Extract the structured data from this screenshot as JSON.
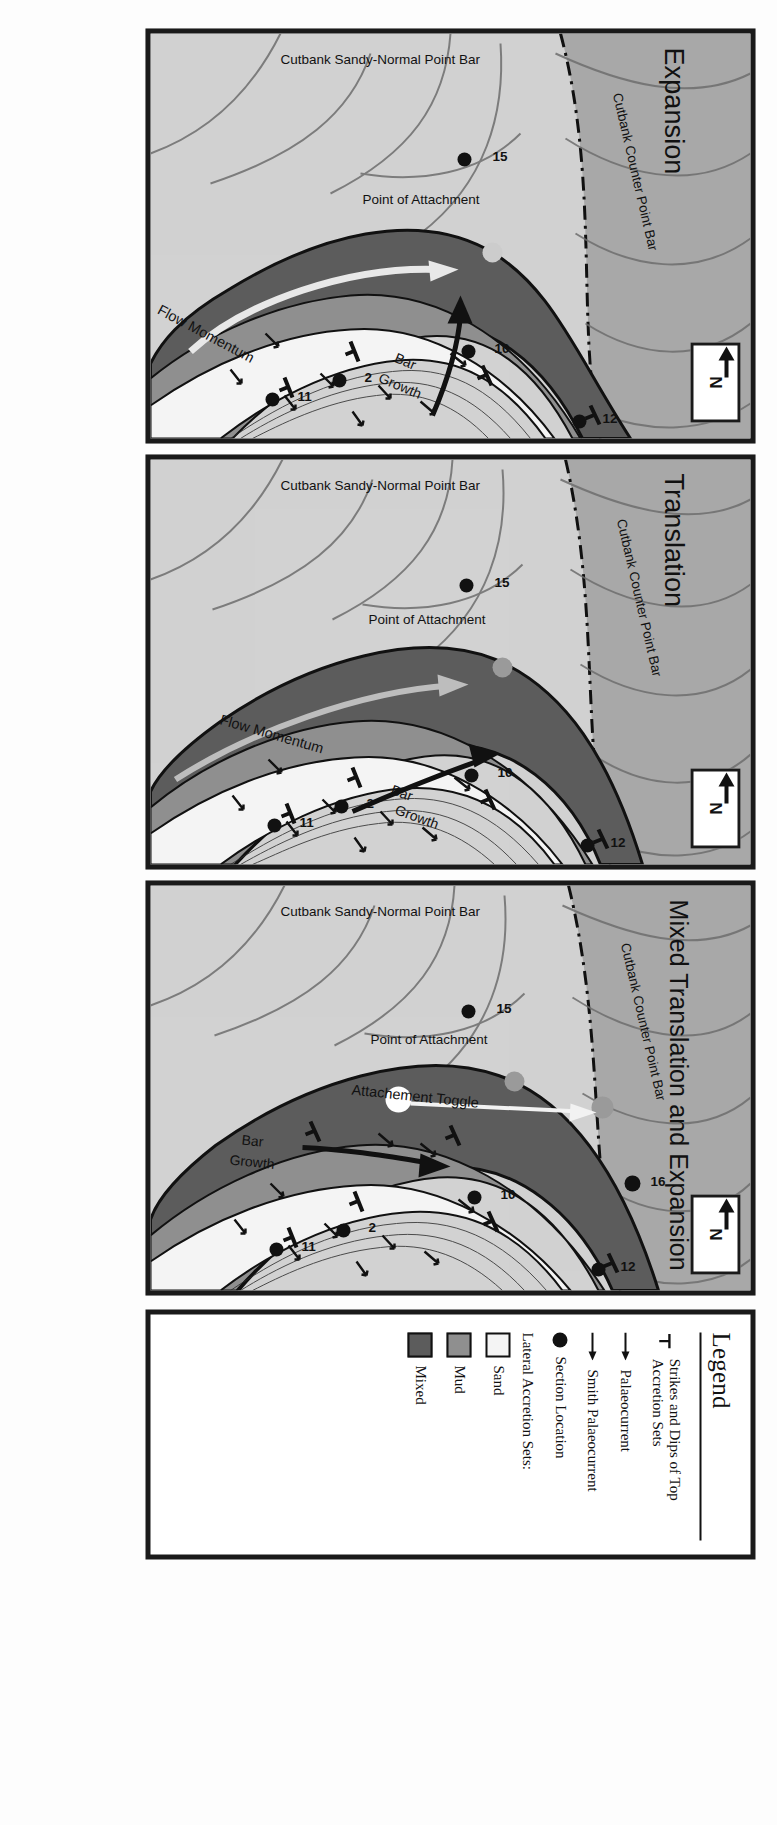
{
  "figure": {
    "orientation": "rotated-90",
    "panel_count": 3
  },
  "colors": {
    "sand": "#f4f4f4",
    "mud": "#8f8f8f",
    "mixed": "#5c5c5c",
    "background_bar": "#d2d2d2",
    "counter_point_bar": "#a8a8a8",
    "outline": "#1a1a1a",
    "accretion_line": "#6e6e6e",
    "flow_arrow": "#e8e8e8",
    "attachment_dot": "#9a9a9a",
    "toggle_dot_white": "#ffffff"
  },
  "panels": [
    {
      "id": "expansion",
      "title": "Expansion",
      "north_label": "N",
      "labels": {
        "counter_point_bar": "Cutbank Counter Point Bar",
        "sandy_normal_point_bar": "Cutbank Sandy-Normal Point Bar",
        "point_of_attachment": "Point of Attachment",
        "flow_momentum": "Flow Momentum",
        "bar_growth_line1": "Bar",
        "bar_growth_line2": "Growth"
      },
      "sections": [
        "15",
        "10",
        "2",
        "12",
        "11"
      ],
      "has_attachment_toggle": false
    },
    {
      "id": "translation",
      "title": "Translation",
      "north_label": "N",
      "labels": {
        "counter_point_bar": "Cutbank Counter Point Bar",
        "sandy_normal_point_bar": "Cutbank Sandy-Normal Point Bar",
        "point_of_attachment": "Point of Attachment",
        "flow_momentum": "Flow Momentum",
        "bar_growth_line1": "Bar",
        "bar_growth_line2": "Growth"
      },
      "sections": [
        "15",
        "10",
        "2",
        "12",
        "11"
      ],
      "has_attachment_toggle": false
    },
    {
      "id": "mixed-translation-and-expansion",
      "title": "Mixed Translation and Expansion",
      "north_label": "N",
      "labels": {
        "counter_point_bar": "Cutbank Counter Point Bar",
        "sandy_normal_point_bar": "Cutbank Sandy-Normal Point Bar",
        "point_of_attachment": "Point of Attachment",
        "attachment_toggle": "Attachement Toggle",
        "bar_growth_line1": "Bar",
        "bar_growth_line2": "Growth"
      },
      "sections": [
        "15",
        "16",
        "10",
        "2",
        "12",
        "11"
      ],
      "has_attachment_toggle": true
    }
  ],
  "legend": {
    "title": "Legend",
    "items": [
      {
        "icon": "strike-dip-symbol",
        "label": "Strikes and Dips of Top Accretion Sets"
      },
      {
        "icon": "arrow-right-icon",
        "label": "Palaeocurrent"
      },
      {
        "icon": "arrow-right-icon",
        "label": "Smith Palaeocurrent"
      },
      {
        "icon": "filled-circle-icon",
        "label": "Section Location"
      }
    ],
    "accretion_heading": "Lateral Accretion Sets:",
    "swatches": [
      {
        "label": "Sand",
        "color": "#f4f4f4"
      },
      {
        "label": "Mud",
        "color": "#8f8f8f"
      },
      {
        "label": "Mixed",
        "color": "#5c5c5c"
      }
    ]
  }
}
